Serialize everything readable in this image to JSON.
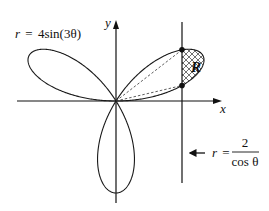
{
  "figure": {
    "axes": {
      "x_label": "x",
      "y_label": "y"
    },
    "curves": {
      "rose": {
        "label_lhs": "r",
        "label_eq": "=",
        "label_rhs": "4sin(3θ)",
        "equation": "r = 4sin(3θ)",
        "amplitude": 4,
        "frequency": 3,
        "color": "#1a1a1a"
      },
      "line": {
        "label_lhs": "r",
        "label_eq": "=",
        "numerator": "2",
        "denominator": "cos θ",
        "equation": "r = 2/cos θ",
        "x_value": 2,
        "color": "#1a1a1a"
      }
    },
    "region": {
      "label": "R",
      "fill_pattern": "crosshatch"
    }
  }
}
